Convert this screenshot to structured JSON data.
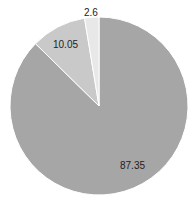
{
  "chart_data": {
    "type": "pie",
    "title": "",
    "categories": [
      "Slice A",
      "Slice B",
      "Slice C"
    ],
    "values": [
      87.35,
      10.05,
      2.6
    ],
    "data_labels": [
      "87.35",
      "10.05",
      "2.6"
    ],
    "colors": [
      "#a6a6a6",
      "#c9c9c9",
      "#e8e8e8"
    ],
    "start_angle_deg": 0,
    "direction": "clockwise",
    "legend": "none",
    "separator_color": "#ffffff"
  }
}
